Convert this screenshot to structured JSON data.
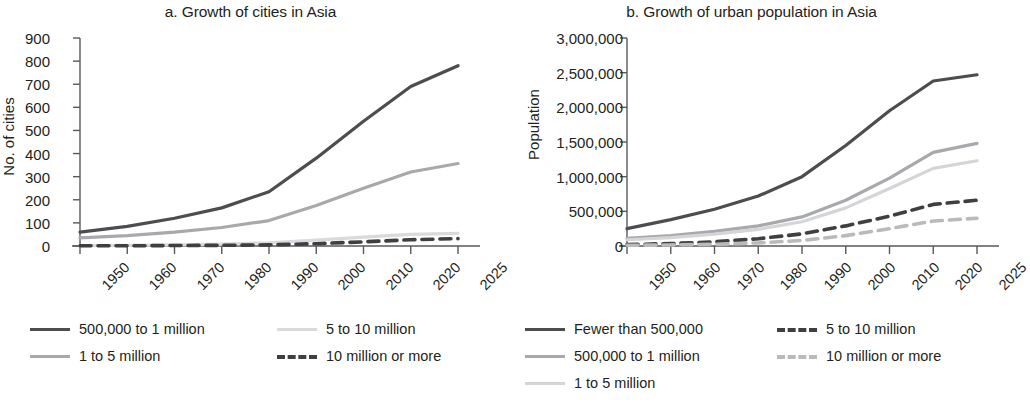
{
  "figure": {
    "panel_a_title": "a. Growth of cities in Asia",
    "panel_b_title": "b. Growth of urban population in Asia"
  },
  "chart_data": [
    {
      "type": "line",
      "title": "a. Growth of cities in Asia",
      "xlabel": "",
      "ylabel": "No. of cities",
      "categories": [
        "1950",
        "1960",
        "1970",
        "1980",
        "1990",
        "2000",
        "2010",
        "2020",
        "2025"
      ],
      "x": [
        1950,
        1960,
        1970,
        1980,
        1990,
        2000,
        2010,
        2020,
        2025
      ],
      "ylim": [
        0,
        900
      ],
      "yticks": [
        0,
        100,
        200,
        300,
        400,
        500,
        600,
        700,
        800,
        900
      ],
      "ytick_labels": [
        "0",
        "100",
        "200",
        "300",
        "400",
        "500",
        "600",
        "700",
        "800",
        "900"
      ],
      "grid": false,
      "legend_position": "below",
      "series": [
        {
          "name": "500,000 to 1 million",
          "color": "#4d4d4f",
          "style": "solid",
          "values": [
            60,
            85,
            120,
            165,
            235,
            380,
            540,
            690,
            780
          ]
        },
        {
          "name": "1 to 5 million",
          "color": "#a7a9ac",
          "style": "solid",
          "values": [
            35,
            45,
            60,
            80,
            110,
            175,
            250,
            320,
            357
          ]
        },
        {
          "name": "5 to 10 million",
          "color": "#d9dadb",
          "style": "solid",
          "values": [
            2,
            3,
            5,
            8,
            14,
            25,
            38,
            50,
            55
          ]
        },
        {
          "name": "10 million or more",
          "color": "#3f3f41",
          "style": "dashed",
          "values": [
            1,
            1,
            2,
            3,
            5,
            10,
            18,
            27,
            32
          ]
        }
      ]
    },
    {
      "type": "line",
      "title": "b. Growth of urban population in Asia",
      "xlabel": "",
      "ylabel": "Population",
      "categories": [
        "1950",
        "1960",
        "1970",
        "1980",
        "1990",
        "2000",
        "2010",
        "2020",
        "2025"
      ],
      "x": [
        1950,
        1960,
        1970,
        1980,
        1990,
        2000,
        2010,
        2020,
        2025
      ],
      "ylim": [
        0,
        3000000
      ],
      "yticks": [
        0,
        500000,
        1000000,
        1500000,
        2000000,
        2500000,
        3000000
      ],
      "ytick_labels": [
        "0",
        "500,000",
        "1,000,000",
        "1,500,000",
        "2,000,000",
        "2,500,000",
        "3,000,000"
      ],
      "grid": false,
      "legend_position": "below",
      "series": [
        {
          "name": "Fewer than 500,000",
          "color": "#4d4d4f",
          "style": "solid",
          "values": [
            250000,
            380000,
            530000,
            720000,
            1000000,
            1450000,
            1950000,
            2380000,
            2470000
          ]
        },
        {
          "name": "500,000 to 1 million",
          "color": "#a7a9ac",
          "style": "solid",
          "values": [
            110000,
            150000,
            210000,
            290000,
            420000,
            660000,
            980000,
            1350000,
            1480000
          ]
        },
        {
          "name": "1 to 5 million",
          "color": "#d4d5d7",
          "style": "solid",
          "values": [
            90000,
            120000,
            170000,
            240000,
            350000,
            550000,
            830000,
            1120000,
            1230000
          ]
        },
        {
          "name": "5 to 10 million",
          "color": "#3f3f41",
          "style": "dashed",
          "values": [
            20000,
            35000,
            60000,
            105000,
            175000,
            290000,
            430000,
            600000,
            660000
          ]
        },
        {
          "name": "10 million or more",
          "color": "#b9babc",
          "style": "dashed",
          "values": [
            10000,
            15000,
            25000,
            45000,
            80000,
            150000,
            250000,
            360000,
            400000
          ]
        }
      ]
    }
  ]
}
